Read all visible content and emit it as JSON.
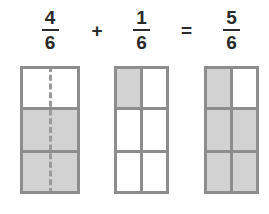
{
  "equation": {
    "terms": [
      {
        "kind": "fraction",
        "numerator": "4",
        "denominator": "6",
        "name": "first-fraction"
      },
      {
        "kind": "operator",
        "symbol": "+",
        "name": "plus-operator"
      },
      {
        "kind": "fraction",
        "numerator": "1",
        "denominator": "6",
        "name": "second-fraction"
      },
      {
        "kind": "operator",
        "symbol": "=",
        "name": "equals-operator"
      },
      {
        "kind": "fraction",
        "numerator": "5",
        "denominator": "6",
        "name": "sum-fraction"
      }
    ],
    "plus_symbol": "+",
    "equals_symbol": "=",
    "first_numerator": "4",
    "first_denominator": "6",
    "second_numerator": "1",
    "second_denominator": "6",
    "sum_numerator": "5",
    "sum_denominator": "6"
  },
  "models": {
    "first": {
      "label": "4/6",
      "rows": 3,
      "columns": 2,
      "total_parts": 6,
      "shaded_parts": 4,
      "divider_style": "dashed",
      "cells": [
        {
          "shaded": false
        },
        {
          "shaded": false
        },
        {
          "shaded": true
        },
        {
          "shaded": true
        },
        {
          "shaded": true
        },
        {
          "shaded": true
        }
      ]
    },
    "second": {
      "label": "1/6",
      "rows": 3,
      "columns": 2,
      "total_parts": 6,
      "shaded_parts": 1,
      "divider_style": "solid",
      "cells": [
        {
          "shaded": true
        },
        {
          "shaded": false
        },
        {
          "shaded": false
        },
        {
          "shaded": false
        },
        {
          "shaded": false
        },
        {
          "shaded": false
        }
      ]
    },
    "third": {
      "label": "5/6",
      "rows": 3,
      "columns": 2,
      "total_parts": 6,
      "shaded_parts": 5,
      "divider_style": "solid",
      "cells": [
        {
          "shaded": true
        },
        {
          "shaded": false
        },
        {
          "shaded": true
        },
        {
          "shaded": true
        },
        {
          "shaded": true
        },
        {
          "shaded": true
        }
      ]
    }
  },
  "colors": {
    "shaded_fill": "#d2d2d2",
    "unshaded_fill": "#ffffff",
    "grid_line": "#8d8d8d",
    "dashed_line": "#9a9a9a",
    "text": "#2a2a2a",
    "background": "#ffffff"
  }
}
